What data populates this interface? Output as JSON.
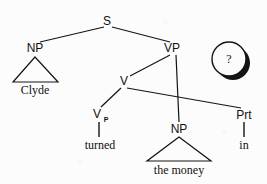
{
  "diagram": {
    "background_color": "#fcfcfc",
    "line_color": "#141414",
    "text_color": "#111111"
  },
  "nodes": {
    "s": {
      "label": "S",
      "x": 107,
      "y": 21
    },
    "np_subject": {
      "label": "NP",
      "x": 35,
      "y": 48
    },
    "vp": {
      "label": "VP",
      "x": 172,
      "y": 48
    },
    "v_upper": {
      "label": "V",
      "x": 124,
      "y": 81
    },
    "v_particle": {
      "label": "V",
      "x": 97,
      "y": 114
    },
    "v_particle_superscript": {
      "label": "P",
      "x": 106,
      "y": 119
    },
    "np_object": {
      "label": "NP",
      "x": 179,
      "y": 129
    },
    "prt": {
      "label": "Prt",
      "x": 244,
      "y": 115
    }
  },
  "terminals": {
    "clyde": {
      "label": "Clyde",
      "x": 35,
      "y": 90
    },
    "turned": {
      "label": "turned",
      "x": 100,
      "y": 145
    },
    "the_money": {
      "label": "the money",
      "x": 179,
      "y": 170
    },
    "in": {
      "label": "in",
      "x": 244,
      "y": 145
    }
  },
  "annotation": {
    "badge_symbol": "?",
    "badge_name": "question-mark-badge",
    "badge_cx": 229,
    "badge_cy": 59,
    "badge_r": 17
  },
  "sentence": {
    "words": [
      "Clyde",
      "turned",
      "the money",
      "in"
    ],
    "full_text": "Clyde turned the money in"
  },
  "triangles": {
    "subject": {
      "apex_x": 35,
      "apex_y": 57,
      "left_x": 13,
      "right_x": 58,
      "base_y": 82
    },
    "object": {
      "apex_x": 179,
      "apex_y": 137,
      "left_x": 147,
      "right_x": 211,
      "base_y": 161
    }
  },
  "edges": [
    {
      "name": "s-to-np",
      "x1": 104,
      "y1": 27,
      "x2": 40,
      "y2": 42
    },
    {
      "name": "s-to-vp",
      "x1": 112,
      "y1": 27,
      "x2": 170,
      "y2": 42
    },
    {
      "name": "vp-to-v",
      "x1": 170,
      "y1": 55,
      "x2": 130,
      "y2": 76
    },
    {
      "name": "vp-to-np-object",
      "x1": 176,
      "y1": 55,
      "x2": 179,
      "y2": 122
    },
    {
      "name": "v-to-vp-head",
      "x1": 121,
      "y1": 88,
      "x2": 101,
      "y2": 107
    },
    {
      "name": "v-to-prt",
      "x1": 127,
      "y1": 88,
      "x2": 241,
      "y2": 108
    },
    {
      "name": "vhead-to-turned",
      "x1": 99,
      "y1": 122,
      "x2": 99,
      "y2": 137
    },
    {
      "name": "prt-to-in",
      "x1": 244,
      "y1": 122,
      "x2": 244,
      "y2": 137
    }
  ]
}
